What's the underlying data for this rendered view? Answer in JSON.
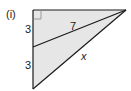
{
  "diagram": {
    "part_label": "(i)",
    "labels": {
      "upper_left_segment": "3",
      "lower_left_segment": "3",
      "inner_line": "7",
      "hypotenuse": "x"
    },
    "colors": {
      "fill": "#e6e6e6",
      "stroke": "#1a1a1a"
    },
    "right_angle_marker": true
  }
}
